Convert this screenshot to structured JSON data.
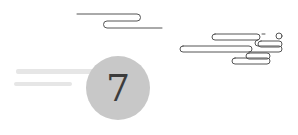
{
  "badge": {
    "numeral": "7",
    "fill_color": "#c8c8c8",
    "text_color": "#3c3c3c"
  },
  "decorations": {
    "cloud_line_color": "#555555",
    "top_cloud": "cloud-line-icon",
    "right_cloud": "cloud-line-icon",
    "blur_bars": 2
  }
}
